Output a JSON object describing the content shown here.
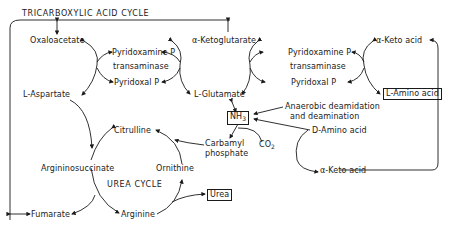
{
  "title": "TRICARBOXYLIC ACID CYCLE",
  "left_transamination": {
    "donor": "L-Aspartate",
    "acceptor_product": "Oxaloacetate",
    "enzyme_top": "Pyridoxamine P",
    "enzyme_mid": "transaminase",
    "enzyme_bottom": "Pyridoxal P"
  },
  "right_transamination": {
    "keto_acceptor": "α-Ketoglutarate",
    "amino_product": "L-Glutamate",
    "enzyme_top": "Pyridoxamine P",
    "enzyme_mid": "transaminase",
    "enzyme_bottom": "Pyridoxal P",
    "keto_acid": "α-Keto acid",
    "amino_acid": "L-Amino acid"
  },
  "ammonia": {
    "label": "NH3",
    "label_main": "NH",
    "label_sub": "3",
    "process_line1": "Anaerobic deamidation",
    "process_line2": "and deamination",
    "d_amino_acid": "D-Amino acid",
    "d_keto_acid": "α-Keto acid",
    "co2_main": "CO",
    "co2_sub": "2",
    "carbamyl_line1": "Carbamyl",
    "carbamyl_line2": "phosphate"
  },
  "urea_cycle": {
    "title": "UREA CYCLE",
    "citrulline": "Citrulline",
    "argininosuccinate": "Argininosuccinate",
    "ornithine": "Ornithine",
    "arginine": "Arginine",
    "fumarate": "Fumarate",
    "urea": "Urea"
  }
}
